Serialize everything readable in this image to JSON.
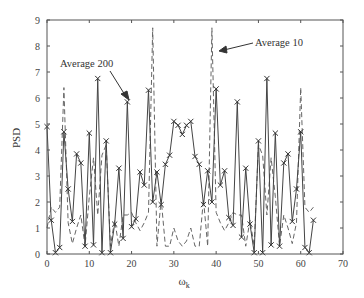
{
  "chart_data": {
    "type": "line",
    "title": "",
    "xlabel": "ω_k",
    "ylabel": "PSD",
    "xlim": [
      0,
      70
    ],
    "ylim": [
      0,
      9
    ],
    "xticks": [
      0,
      10,
      20,
      30,
      40,
      50,
      60,
      70
    ],
    "yticks": [
      0,
      1,
      2,
      3,
      4,
      5,
      6,
      7,
      8,
      9
    ],
    "grid": false,
    "legend": "none (inline annotations)",
    "annotations": [
      {
        "text": "Average 200",
        "points_to": [
          19,
          5.85
        ]
      },
      {
        "text": "Average 10",
        "points_to": [
          39,
          7.9
        ]
      }
    ],
    "x": [
      0,
      1,
      2,
      3,
      4,
      5,
      6,
      7,
      8,
      9,
      10,
      11,
      12,
      13,
      14,
      15,
      16,
      17,
      18,
      19,
      20,
      21,
      22,
      23,
      24,
      25,
      26,
      27,
      28,
      29,
      30,
      31,
      32,
      33,
      34,
      35,
      36,
      37,
      38,
      39,
      40,
      41,
      42,
      43,
      44,
      45,
      46,
      47,
      48,
      49,
      50,
      51,
      52,
      53,
      54,
      55,
      56,
      57,
      58,
      59,
      60,
      61,
      62,
      63
    ],
    "series": [
      {
        "name": "Average 200",
        "style": "solid with x markers",
        "values": [
          4.9,
          1.3,
          0.05,
          0.25,
          4.7,
          2.5,
          1.25,
          3.85,
          3.5,
          0.3,
          4.65,
          0.35,
          6.75,
          0.05,
          4.35,
          0.05,
          1.15,
          3.3,
          0.6,
          5.85,
          1.05,
          1.35,
          3.15,
          2.65,
          6.3,
          2.0,
          3.15,
          1.9,
          3.45,
          3.8,
          5.1,
          4.95,
          4.6,
          4.95,
          5.1,
          3.75,
          3.45,
          1.9,
          3.2,
          2.0,
          6.35,
          2.65,
          3.2,
          1.4,
          1.1,
          5.85,
          0.65,
          3.3,
          1.15,
          0.05,
          4.35,
          0.05,
          6.75,
          0.35,
          4.65,
          0.3,
          3.5,
          3.85,
          1.25,
          2.5,
          4.7,
          0.25,
          0.05,
          1.3
        ]
      },
      {
        "name": "Average 10",
        "style": "dashed",
        "values": [
          1.0,
          1.8,
          1.6,
          1.8,
          6.4,
          1.2,
          0.4,
          1.0,
          1.5,
          0.3,
          2.2,
          3.7,
          1.5,
          3.8,
          4.2,
          0.3,
          1.3,
          0.3,
          1.5,
          1.5,
          1.6,
          1.2,
          0.9,
          1.2,
          1.6,
          8.7,
          0.3,
          2.1,
          0.3,
          0.3,
          1.0,
          0.5,
          0.3,
          0.5,
          1.0,
          0.3,
          0.3,
          2.1,
          0.3,
          8.7,
          1.6,
          1.2,
          0.9,
          1.2,
          1.6,
          1.5,
          1.5,
          0.3,
          1.3,
          0.3,
          4.2,
          3.8,
          1.5,
          3.7,
          2.2,
          0.3,
          1.5,
          1.0,
          0.4,
          1.2,
          6.4,
          1.8,
          1.6,
          1.8
        ]
      }
    ]
  },
  "axes": {
    "xlabel": "ω",
    "xlabel_sub": "k",
    "ylabel": "PSD",
    "xtick_labels": [
      "0",
      "10",
      "20",
      "30",
      "40",
      "50",
      "60",
      "70"
    ],
    "ytick_labels": [
      "0",
      "1",
      "2",
      "3",
      "4",
      "5",
      "6",
      "7",
      "8",
      "9"
    ]
  },
  "annotations": {
    "avg200": "Average 200",
    "avg10": "Average 10"
  }
}
